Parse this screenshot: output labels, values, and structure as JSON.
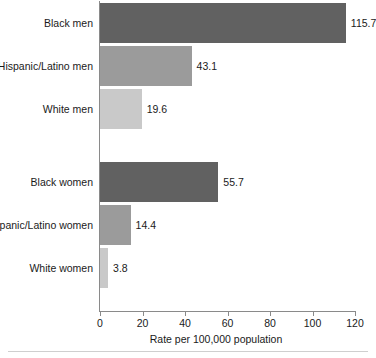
{
  "chart_data": {
    "type": "bar",
    "orientation": "horizontal",
    "title": "",
    "subtitle": "",
    "xlabel": "Rate per 100,000 population",
    "ylabel": "",
    "xlim": [
      0,
      120
    ],
    "xticks": [
      0,
      20,
      40,
      60,
      80,
      100,
      120
    ],
    "xtick_labels": [
      "0",
      "20",
      "40",
      "60",
      "80",
      "100",
      "120"
    ],
    "grid": false,
    "legend": false,
    "categories": [
      "Black men",
      "Hispanic/Latino men",
      "White men",
      "Black women",
      "Hispanic/Latino women",
      "White women"
    ],
    "values": [
      115.7,
      43.1,
      19.6,
      55.7,
      14.4,
      3.8
    ],
    "value_labels": [
      "115.7",
      "43.1",
      "19.6",
      "55.7",
      "14.4",
      "3.8"
    ],
    "bar_colors": [
      "#616161",
      "#9b9b9b",
      "#c9c9c9",
      "#616161",
      "#9b9b9b",
      "#c9c9c9"
    ],
    "groups": [
      {
        "name": "men",
        "categories": [
          "Black men",
          "Hispanic/Latino men",
          "White men"
        ]
      },
      {
        "name": "women",
        "categories": [
          "Black women",
          "Hispanic/Latino women",
          "White women"
        ]
      }
    ],
    "bars": [
      {
        "category": "Black men",
        "value": 115.7,
        "label": "115.7",
        "color": "#616161",
        "top": 3
      },
      {
        "category": "Hispanic/Latino men",
        "value": 43.1,
        "label": "43.1",
        "color": "#9b9b9b",
        "top": 46
      },
      {
        "category": "White men",
        "value": 19.6,
        "label": "19.6",
        "color": "#c9c9c9",
        "top": 89
      },
      {
        "category": "Black women",
        "value": 55.7,
        "label": "55.7",
        "color": "#616161",
        "top": 162
      },
      {
        "category": "Hispanic/Latino women",
        "value": 14.4,
        "label": "14.4",
        "color": "#9b9b9b",
        "top": 205
      },
      {
        "category": "White women",
        "value": 3.8,
        "label": "3.8",
        "color": "#c9c9c9",
        "top": 248
      }
    ],
    "axis_color": "#8a8a8a",
    "background_color": "#ffffff",
    "text_color": "#1a1a1a"
  }
}
